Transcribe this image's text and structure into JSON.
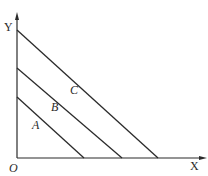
{
  "diagram": {
    "axes": {
      "x_label": "X",
      "y_label": "Y",
      "origin_label": "O"
    },
    "lines": [
      {
        "label": "A",
        "y_intercept_px": 97,
        "x_intercept_px": 84
      },
      {
        "label": "B",
        "y_intercept_px": 68,
        "x_intercept_px": 122
      },
      {
        "label": "C",
        "y_intercept_px": 30,
        "x_intercept_px": 158
      }
    ],
    "colors": {
      "line": "#2a2a2a",
      "background": "#ffffff"
    }
  }
}
